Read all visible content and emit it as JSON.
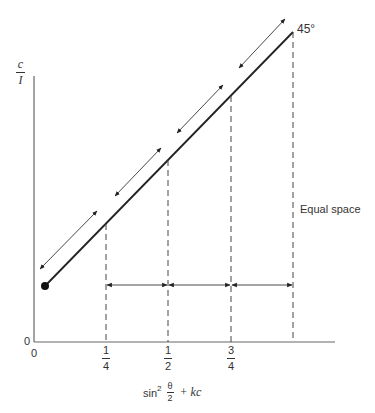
{
  "diagram": {
    "y_axis_label": {
      "numerator": "c",
      "denominator": "I"
    },
    "x_axis_label": {
      "prefix": "sin",
      "power": "2",
      "frac_num": "θ",
      "frac_den": "2",
      "suffix": "+ kc"
    },
    "origin_y_label": "0",
    "origin_x_label": "0",
    "angle_label": "45°",
    "annotation": "Equal space",
    "ticks": [
      {
        "num": "1",
        "den": "4"
      },
      {
        "num": "1",
        "den": "2"
      },
      {
        "num": "3",
        "den": "4"
      }
    ],
    "colors": {
      "line": "#222222",
      "axis": "#555555",
      "dash": "#444444"
    }
  }
}
